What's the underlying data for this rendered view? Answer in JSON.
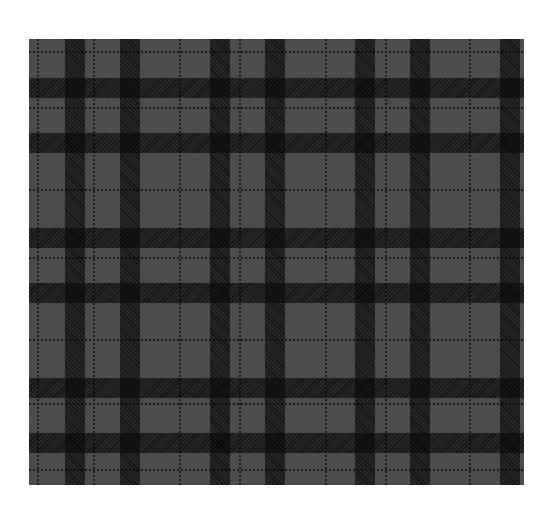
{
  "image": {
    "subject": "grey and black tartan plaid fabric pattern",
    "background": "#ffffff",
    "plaid": {
      "x": 29,
      "y": 39,
      "width": 495,
      "height": 446,
      "base_color": "#4a4a4a",
      "dark_band_color": "#141414",
      "vertical_bands_x": [
        36,
        91,
        181,
        236,
        326,
        381,
        471
      ],
      "horizontal_bands_y": [
        39,
        94,
        189,
        244,
        339,
        394
      ],
      "vertical_lines_x": [
        8,
        64,
        150,
        210,
        296,
        356,
        440
      ],
      "horizontal_lines_y": [
        12,
        68,
        150,
        218,
        300,
        364,
        430
      ]
    }
  }
}
